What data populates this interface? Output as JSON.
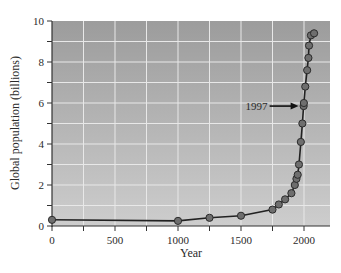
{
  "chart_data": {
    "type": "line",
    "title": "",
    "xlabel": "Year",
    "ylabel": "Global population (billions)",
    "xlim": [
      0,
      2200
    ],
    "ylim": [
      0,
      10
    ],
    "x_ticks": [
      0,
      250,
      500,
      750,
      1000,
      1250,
      1500,
      1750,
      2000
    ],
    "x_tick_labels": [
      "0",
      "",
      "500",
      "",
      "1000",
      "",
      "1500",
      "",
      "2000"
    ],
    "y_ticks": [
      0,
      1,
      2,
      3,
      4,
      5,
      6,
      7,
      8,
      9,
      10
    ],
    "y_tick_labels": [
      "0",
      "",
      "2",
      "",
      "4",
      "",
      "6",
      "",
      "8",
      "",
      "10"
    ],
    "grid": true,
    "legend": null,
    "series": [
      {
        "name": "Global population",
        "x": [
          0,
          1000,
          1250,
          1500,
          1750,
          1800,
          1850,
          1900,
          1927,
          1940,
          1950,
          1960,
          1975,
          1987,
          1997,
          1999,
          2010,
          2025,
          2035,
          2040,
          2055,
          2080
        ],
        "y": [
          0.3,
          0.25,
          0.4,
          0.5,
          0.8,
          1.05,
          1.3,
          1.6,
          2.0,
          2.3,
          2.5,
          3.0,
          4.1,
          5.0,
          5.85,
          6.0,
          6.8,
          7.6,
          8.2,
          8.8,
          9.3,
          9.4
        ]
      }
    ],
    "annotations": [
      {
        "text": "1997",
        "x": 1997,
        "y": 5.85,
        "arrow": true
      }
    ]
  },
  "labels": {
    "xlabel": "Year",
    "ylabel": "Global population (billions)",
    "annotation": "1997"
  },
  "colors": {
    "plot_bg_top": "#9c9c9c",
    "plot_bg_bottom": "#cdcdcd",
    "grid": "#e8e8e8",
    "line": "#222222",
    "marker_fill": "#6e6e6e",
    "marker_stroke": "#2a2a2a",
    "axis": "#333333"
  }
}
